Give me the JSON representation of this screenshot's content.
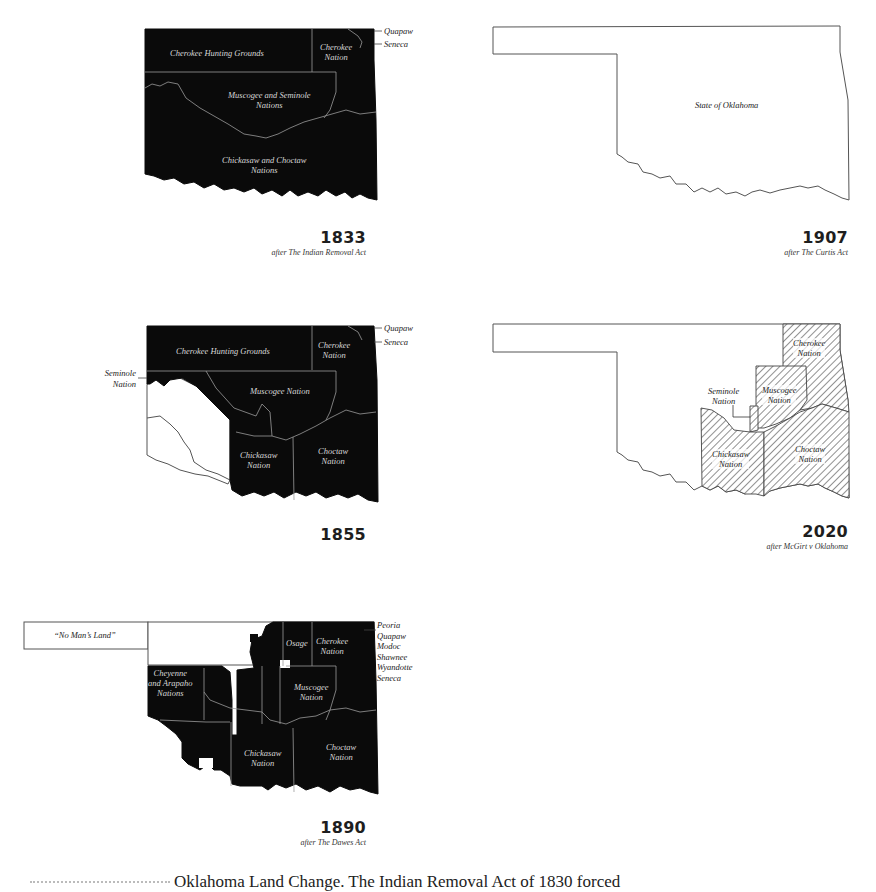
{
  "figure": {
    "panels": [
      {
        "id": "1833",
        "year": "1833",
        "subtitle": "after The Indian Removal Act",
        "labels": {
          "cherokee_hunting": "Cherokee Hunting Grounds",
          "cherokee_nation_1": "Cherokee",
          "cherokee_nation_2": "Nation",
          "muscogee_1": "Muscogee and Seminole",
          "muscogee_2": "Nations",
          "chickasaw_1": "Chickasaw and Choctaw",
          "chickasaw_2": "Nations"
        },
        "side_labels": [
          "Quapaw",
          "Seneca"
        ]
      },
      {
        "id": "1907",
        "year": "1907",
        "subtitle": "after The Curtis Act",
        "labels": {
          "state": "State of Oklahoma"
        }
      },
      {
        "id": "1855",
        "year": "1855",
        "subtitle": "",
        "labels": {
          "cherokee_hunting": "Cherokee Hunting Grounds",
          "cherokee_nation_1": "Cherokee",
          "cherokee_nation_2": "Nation",
          "muscogee": "Muscogee Nation",
          "chickasaw_1": "Chickasaw",
          "chickasaw_2": "Nation",
          "choctaw_1": "Choctaw",
          "choctaw_2": "Nation",
          "seminole_1": "Seminole",
          "seminole_2": "Nation"
        },
        "side_labels": [
          "Quapaw",
          "Seneca"
        ]
      },
      {
        "id": "2020",
        "year": "2020",
        "subtitle": "after McGirt v Oklahoma",
        "labels": {
          "cherokee_1": "Cherokee",
          "cherokee_2": "Nation",
          "muscogee_1": "Muscogee",
          "muscogee_2": "Nation",
          "seminole_1": "Seminole",
          "seminole_2": "Nation",
          "chickasaw_1": "Chickasaw",
          "chickasaw_2": "Nation",
          "choctaw_1": "Choctaw",
          "choctaw_2": "Nation"
        }
      },
      {
        "id": "1890",
        "year": "1890",
        "subtitle": "after The Dawes Act",
        "labels": {
          "no_mans_land": "“No Man’s Land”",
          "osage": "Osage",
          "cherokee_1": "Cherokee",
          "cherokee_2": "Nation",
          "cheyenne_1": "Cheyenne",
          "cheyenne_2": "and Arapaho",
          "cheyenne_3": "Nations",
          "muscogee_1": "Muscogee",
          "muscogee_2": "Nation",
          "chickasaw_1": "Chickasaw",
          "chickasaw_2": "Nation",
          "choctaw_1": "Choctaw",
          "choctaw_2": "Nation"
        },
        "side_labels": [
          "Peoria",
          "Quapaw",
          "Modoc",
          "Shawnee",
          "Wyandotte",
          "Seneca"
        ]
      }
    ],
    "colors": {
      "territory_fill": "#0a0a0a",
      "outline": "#555555",
      "inner_border": "#9a9a9a",
      "hatch": "#444444",
      "background": "#ffffff"
    }
  },
  "caption": {
    "text": "Oklahoma Land Change. The Indian Removal Act of 1830 forced"
  }
}
